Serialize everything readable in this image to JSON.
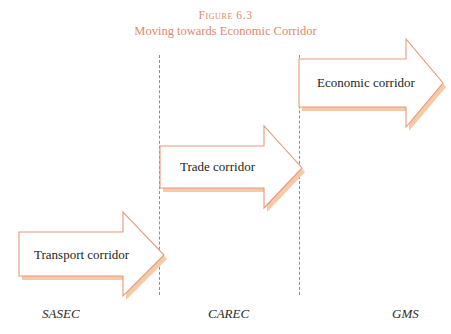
{
  "figure": {
    "number_label": "Figure 6.3",
    "caption": "Moving towards Economic Corridor",
    "title_color": "#d98b6e"
  },
  "colors": {
    "arrow_outline": "#e69a7b",
    "arrow_shadow": "#f7c9a8",
    "arrow_fill": "#ffffff",
    "divider": "#e0714a",
    "label_text": "#2b2b2b",
    "background": "#ffffff"
  },
  "dividers": [
    {
      "name": "divider-after-sasec",
      "x": 159
    },
    {
      "name": "divider-after-carec",
      "x": 299
    }
  ],
  "arrows": [
    {
      "id": "transport-corridor",
      "label": "Transport corridor",
      "stage": 1,
      "from_region": "SASEC",
      "to_region": "CAREC"
    },
    {
      "id": "trade-corridor",
      "label": "Trade corridor",
      "stage": 2,
      "from_region": "CAREC",
      "to_region": "GMS"
    },
    {
      "id": "economic-corridor",
      "label": "Economic corridor",
      "stage": 3,
      "from_region": "GMS",
      "to_region": ""
    }
  ],
  "axis_labels": [
    {
      "id": "sasec",
      "text": "SASEC"
    },
    {
      "id": "carec",
      "text": "CAREC"
    },
    {
      "id": "gms",
      "text": "GMS"
    }
  ]
}
